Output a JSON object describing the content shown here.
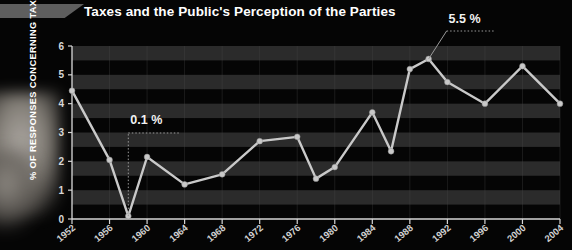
{
  "title": "Taxes and the Public's Perception of the Parties",
  "decor": {
    "top_bar": "gray-bar",
    "silhouette": "blurred-figure"
  },
  "chart_data": {
    "type": "line",
    "title": "Taxes and the Public's Perception of the Parties",
    "xlabel": "",
    "ylabel": "% OF RESPONSES CONCERNING TAXES*",
    "ylim": [
      0,
      6
    ],
    "xlim": [
      1952,
      2004
    ],
    "yticks": [
      0,
      1,
      2,
      3,
      4,
      5,
      6
    ],
    "xticks": [
      1952,
      1956,
      1960,
      1964,
      1968,
      1972,
      1976,
      1980,
      1984,
      1988,
      1992,
      1996,
      2000,
      2004
    ],
    "grid": "horizontal-bands",
    "legend": "none",
    "series": [
      {
        "name": "% of responses concerning taxes",
        "color": "#c9c9c9",
        "x": [
          1952,
          1956,
          1958,
          1960,
          1964,
          1968,
          1972,
          1976,
          1978,
          1980,
          1984,
          1986,
          1988,
          1990,
          1992,
          1996,
          2000,
          2004
        ],
        "values": [
          4.45,
          2.05,
          0.1,
          2.15,
          1.2,
          1.55,
          2.7,
          2.85,
          1.4,
          1.8,
          3.7,
          2.35,
          5.2,
          5.55,
          4.75,
          4.0,
          5.3,
          4.0
        ]
      }
    ],
    "annotations": [
      {
        "label": "0.1 %",
        "x": 1958,
        "y": 0.1
      },
      {
        "label": "5.5 %",
        "x": 1990,
        "y": 5.55
      }
    ]
  }
}
